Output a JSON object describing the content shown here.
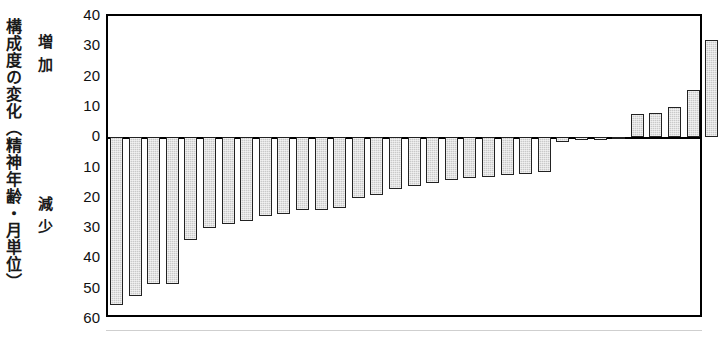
{
  "chart_data": {
    "type": "bar",
    "title": "",
    "xlabel": "",
    "ylabel": "構成度の変化（精神年齢・月単位）",
    "ylim": [
      -60,
      40
    ],
    "grid": false,
    "legend": null,
    "y_axis": {
      "ticks": [
        40,
        30,
        20,
        10,
        0,
        10,
        20,
        30,
        40,
        50,
        60
      ],
      "tick_labels": [
        "40",
        "30",
        "20",
        "10",
        "0",
        "10",
        "20",
        "30",
        "40",
        "50",
        "60"
      ],
      "tick_values": [
        40,
        30,
        20,
        10,
        0,
        -10,
        -20,
        -30,
        -40,
        -50,
        -60
      ],
      "note": "labels below zero printed without minus sign"
    },
    "direction_labels": {
      "positive": "増加",
      "negative": "減少"
    },
    "categories": [
      "1",
      "2",
      "3",
      "4",
      "5",
      "6",
      "7",
      "8",
      "9",
      "10",
      "11",
      "12",
      "13",
      "14",
      "15",
      "16",
      "17",
      "18",
      "19",
      "20",
      "21",
      "22",
      "23",
      "24",
      "25",
      "26",
      "27",
      "28",
      "29",
      "30",
      "31",
      "32"
    ],
    "values": [
      -55.5,
      -52.5,
      -48.5,
      -48.5,
      -34.0,
      -30.0,
      -28.5,
      -27.5,
      -26.0,
      -25.5,
      -24.0,
      -24.0,
      -23.5,
      -20.0,
      -19.0,
      -17.0,
      -16.0,
      -15.0,
      -14.0,
      -13.5,
      -13.0,
      -12.5,
      -12.0,
      -11.5,
      -1.5,
      -1.0,
      -1.0,
      -0.5,
      7.5,
      8.0,
      10.0,
      15.5
    ],
    "values_extra": [
      32.0
    ],
    "series_name": "構成度の変化"
  },
  "figure": {
    "caption_vertical": "構成度の変化（精神年齢・月単位）",
    "increase_label": "増加",
    "decrease_label": "減少"
  }
}
